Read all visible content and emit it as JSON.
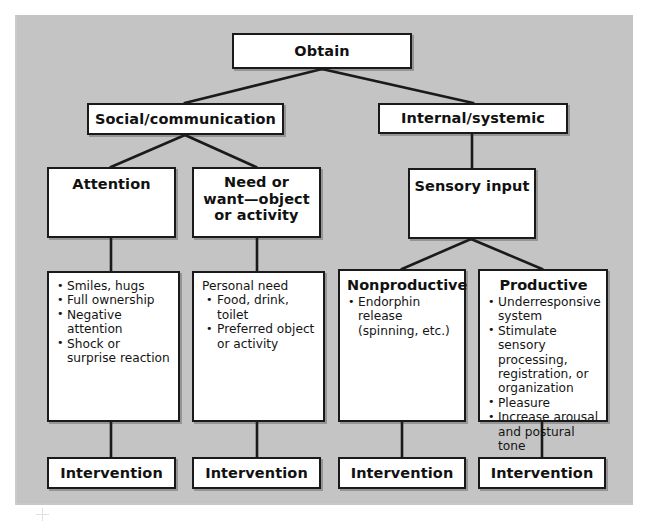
{
  "figure": {
    "background_color": "#c9c9c9",
    "box_fill": "#ffffff",
    "line_color": "#1a1a1a"
  },
  "nodes": {
    "root": {
      "label": "Obtain"
    },
    "level2": [
      {
        "label": "Social/communication"
      },
      {
        "label": "Internal/systemic"
      }
    ],
    "level3": [
      {
        "label": "Attention"
      },
      {
        "label": "Need or\nwant—object\nor activity"
      },
      {
        "label": "Sensory input"
      }
    ],
    "level3_lines": {
      "need_line1": "Need or",
      "need_line2": "want—object",
      "need_line3": "or activity"
    },
    "level4": [
      {
        "header": "",
        "lead": "",
        "bullets": [
          "Smiles, hugs",
          "Full ownership",
          "Negative attention",
          "Shock or surprise reaction"
        ]
      },
      {
        "header": "",
        "lead": "Personal need",
        "bullets": [
          "Food, drink, toilet",
          "Preferred object or activity"
        ]
      },
      {
        "header": "Nonproductive",
        "lead": "",
        "bullets": [
          "Endorphin release (spinning, etc.)"
        ]
      },
      {
        "header": "Productive",
        "lead": "",
        "bullets": [
          "Underresponsive system",
          "Stimulate sensory processing, registration, or organization",
          "Pleasure",
          "Increase arousal and postural tone"
        ]
      }
    ],
    "interventions": [
      {
        "label": "Intervention"
      },
      {
        "label": "Intervention"
      },
      {
        "label": "Intervention"
      },
      {
        "label": "Intervention"
      }
    ]
  },
  "marks": {
    "crop_mark": "registration-crosshair"
  }
}
